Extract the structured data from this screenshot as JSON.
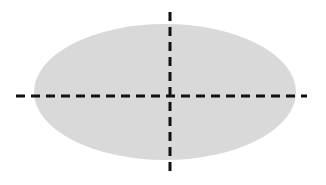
{
  "diagram": {
    "canvas": {
      "width": 326,
      "height": 185,
      "background": "#ffffff"
    },
    "ellipse": {
      "cx": 165,
      "cy": 92,
      "rx": 131,
      "ry": 68,
      "fill": "#d9d9d9"
    },
    "axes": {
      "color": "#111111",
      "stroke_width": 3,
      "dash": "9,6",
      "horizontal": {
        "x1": 16,
        "y1": 96,
        "x2": 307,
        "y2": 96
      },
      "vertical": {
        "x1": 170,
        "y1": 12,
        "x2": 170,
        "y2": 172
      }
    }
  }
}
